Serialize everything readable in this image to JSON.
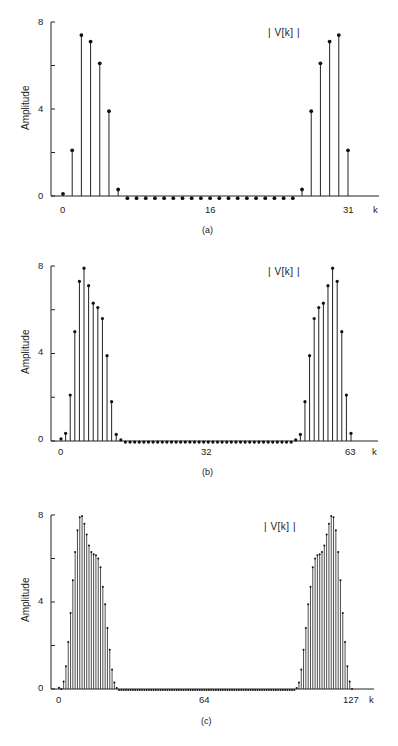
{
  "chart_data": [
    {
      "type": "stem",
      "panel": "a",
      "caption": "(a)",
      "legend": "| V[k] |",
      "ylabel": "Amplitude",
      "xlabel": "k",
      "ylim": [
        0,
        8
      ],
      "yticks": [
        0,
        2,
        4,
        6,
        8
      ],
      "ytick_labels": [
        "0",
        "",
        "4",
        "",
        "8"
      ],
      "xtick_labels": [
        {
          "k": 0,
          "label": "0"
        },
        {
          "k": 16,
          "label": "16"
        },
        {
          "k": 31,
          "label": "31"
        }
      ],
      "N": 32,
      "k": [
        0,
        1,
        2,
        3,
        4,
        5,
        6,
        7,
        8,
        9,
        10,
        11,
        12,
        13,
        14,
        15,
        16,
        17,
        18,
        19,
        20,
        21,
        22,
        23,
        24,
        25,
        26,
        27,
        28,
        29,
        30,
        31
      ],
      "values": [
        0.1,
        2.1,
        7.4,
        7.1,
        6.1,
        3.9,
        0.3,
        -0.1,
        -0.1,
        -0.1,
        -0.1,
        -0.1,
        -0.1,
        -0.1,
        -0.1,
        -0.1,
        -0.1,
        -0.1,
        -0.1,
        -0.1,
        -0.1,
        -0.1,
        -0.1,
        -0.1,
        -0.1,
        -0.1,
        0.3,
        3.9,
        6.1,
        7.1,
        7.4,
        2.1
      ]
    },
    {
      "type": "stem",
      "panel": "b",
      "caption": "(b)",
      "legend": "| V[k] |",
      "ylabel": "Amplitude",
      "xlabel": "k",
      "ylim": [
        0,
        8
      ],
      "yticks": [
        0,
        2,
        4,
        6,
        8
      ],
      "ytick_labels": [
        "0",
        "",
        "4",
        "",
        "8"
      ],
      "xtick_labels": [
        {
          "k": 0,
          "label": "0"
        },
        {
          "k": 32,
          "label": "32"
        },
        {
          "k": 63,
          "label": "63"
        }
      ],
      "N": 64,
      "values": [
        0.1,
        0.35,
        2.1,
        5.0,
        7.3,
        7.9,
        7.1,
        6.3,
        6.1,
        5.6,
        3.9,
        1.8,
        0.3,
        0.05,
        -0.05,
        -0.05,
        -0.05,
        -0.05,
        -0.05,
        -0.05,
        -0.05,
        -0.05,
        -0.05,
        -0.05,
        -0.05,
        -0.05,
        -0.05,
        -0.05,
        -0.05,
        -0.05,
        -0.05,
        -0.05,
        -0.05,
        -0.05,
        -0.05,
        -0.05,
        -0.05,
        -0.05,
        -0.05,
        -0.05,
        -0.05,
        -0.05,
        -0.05,
        -0.05,
        -0.05,
        -0.05,
        -0.05,
        -0.05,
        -0.05,
        -0.05,
        -0.05,
        0.05,
        0.3,
        1.8,
        3.9,
        5.6,
        6.1,
        6.3,
        7.1,
        7.9,
        7.3,
        5.0,
        2.1,
        0.35
      ]
    },
    {
      "type": "stem",
      "panel": "c",
      "caption": "(c)",
      "legend": "| V[k] |",
      "ylabel": "Amplitude",
      "xlabel": "k",
      "ylim": [
        0,
        8
      ],
      "yticks": [
        0,
        2,
        4,
        6,
        8
      ],
      "ytick_labels": [
        "0",
        "",
        "4",
        "",
        "8"
      ],
      "xtick_labels": [
        {
          "k": 0,
          "label": "0"
        },
        {
          "k": 64,
          "label": "64"
        },
        {
          "k": 127,
          "label": "127"
        }
      ],
      "N": 128,
      "values_left_lobe_k0_to_25": [
        0.06,
        0.0,
        0.34,
        1.05,
        2.16,
        3.5,
        5.0,
        6.3,
        7.3,
        7.9,
        7.95,
        7.6,
        7.1,
        6.6,
        6.3,
        6.2,
        6.15,
        6.0,
        5.6,
        4.7,
        3.9,
        2.8,
        1.8,
        0.9,
        0.3,
        0.05
      ],
      "symmetry": "V[k] = V[128-k]",
      "zero_region_value": -0.05
    }
  ],
  "panels": {
    "a": {
      "caption": "(a)",
      "legend": "| V[k] |",
      "ylabel": "Amplitude",
      "xlabel": "k",
      "y8": "8",
      "y4": "4",
      "y0": "0",
      "x0": "0",
      "xmid": "16",
      "xend": "31"
    },
    "b": {
      "caption": "(b)",
      "legend": "| V[k] |",
      "ylabel": "Amplitude",
      "xlabel": "k",
      "y8": "8",
      "y4": "4",
      "y0": "0",
      "x0": "0",
      "xmid": "32",
      "xend": "63"
    },
    "c": {
      "caption": "(c)",
      "legend": "| V[k] |",
      "ylabel": "Amplitude",
      "xlabel": "k",
      "y8": "8",
      "y4": "4",
      "y0": "0",
      "x0": "0",
      "xmid": "64",
      "xend": "127"
    }
  }
}
